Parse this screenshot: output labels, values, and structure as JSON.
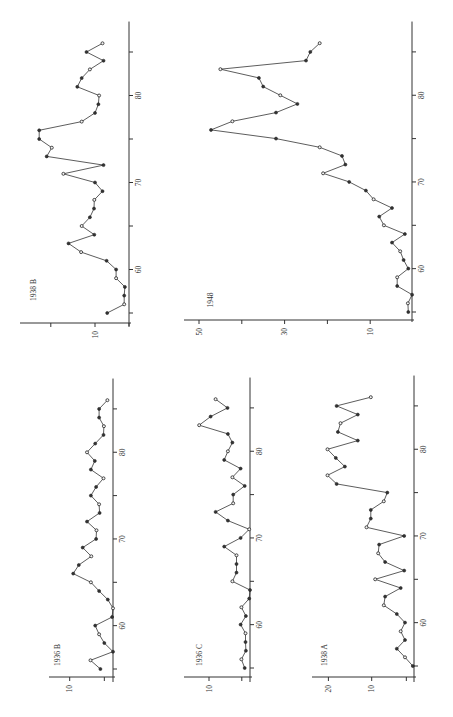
{
  "figure": {
    "orientation_note": "All panels printed rotated 90° counter-clockwise: year axis runs bottom-to-top, value axis runs right-to-left."
  },
  "chart_data": [
    {
      "id": "1938B",
      "type": "line",
      "title": "1938 B",
      "xlabel": "",
      "ylabel": "",
      "x_ticks": [
        55,
        60,
        65,
        70,
        75,
        80,
        85
      ],
      "x_tick_labels": [
        "60",
        "70",
        "80"
      ],
      "y_ticks": [
        0,
        10,
        23
      ],
      "y_tick_labels": [
        "10"
      ],
      "ylim": [
        0,
        32
      ],
      "x": [
        55,
        56,
        57,
        58,
        59,
        60,
        61,
        62,
        63,
        64,
        65,
        66,
        67,
        68,
        69,
        70,
        71,
        72,
        73,
        74,
        75,
        76,
        77,
        78,
        79,
        80,
        81,
        82,
        83,
        84,
        85,
        86
      ],
      "values": [
        6.4,
        1.4,
        1.4,
        1.2,
        3.8,
        3.8,
        6.6,
        14.1,
        17.8,
        10.2,
        13.9,
        11.5,
        10.3,
        10.2,
        7.8,
        10.0,
        19.3,
        7.5,
        24.2,
        22.7,
        26.4,
        26.4,
        13.9,
        10.0,
        9.0,
        8.8,
        15.2,
        13.9,
        11.5,
        7.5,
        12.5,
        7.8
      ]
    },
    {
      "id": "1948",
      "type": "line",
      "title": "1948",
      "xlabel": "",
      "ylabel": "",
      "x_ticks": [
        55,
        60,
        65,
        70,
        75,
        80,
        85
      ],
      "x_tick_labels": [
        "60",
        "70",
        "80"
      ],
      "y_ticks": [
        10,
        20,
        30,
        40,
        50
      ],
      "y_tick_labels": [
        "10",
        "30",
        "50"
      ],
      "ylim": [
        0,
        52
      ],
      "x": [
        55,
        56,
        57,
        58,
        59,
        60,
        61,
        62,
        63,
        64,
        65,
        66,
        67,
        68,
        69,
        70,
        71,
        72,
        73,
        74,
        75,
        76,
        77,
        78,
        79,
        80,
        81,
        82,
        83,
        84,
        85,
        86
      ],
      "values": [
        1.1,
        1.2,
        0.2,
        3.7,
        3.7,
        1.1,
        2.2,
        3.0,
        4.9,
        1.9,
        6.8,
        7.9,
        4.9,
        9.2,
        11.0,
        14.9,
        21.0,
        15.8,
        16.6,
        21.8,
        32.0,
        47.2,
        42.2,
        32.0,
        27.0,
        31.0,
        35.0,
        36.0,
        45.0,
        25.0,
        24.0,
        21.8
      ]
    },
    {
      "id": "1936B",
      "type": "line",
      "title": "1936 B",
      "xlabel": "",
      "ylabel": "",
      "x_ticks": [
        55,
        60,
        65,
        70,
        75,
        80,
        85
      ],
      "x_tick_labels": [
        "60",
        "70",
        "80"
      ],
      "y_ticks": [
        2,
        10
      ],
      "y_tick_labels": [
        "10"
      ],
      "ylim": [
        0,
        15
      ],
      "x": [
        55,
        56,
        57,
        58,
        59,
        60,
        61,
        62,
        63,
        64,
        65,
        66,
        67,
        68,
        69,
        70,
        71,
        72,
        73,
        74,
        75,
        76,
        77,
        78,
        79,
        80,
        81,
        82,
        83,
        84,
        85,
        86
      ],
      "values": [
        2.9,
        5.2,
        0.0,
        2.0,
        3.2,
        4.1,
        0.2,
        0.0,
        1.2,
        3.2,
        5.1,
        9.2,
        7.9,
        5.0,
        7.0,
        3.9,
        3.8,
        6.0,
        3.1,
        3.2,
        5.1,
        3.9,
        2.2,
        5.1,
        4.2,
        6.0,
        4.1,
        2.2,
        2.1,
        3.2,
        3.2,
        1.3
      ]
    },
    {
      "id": "1936C",
      "type": "line",
      "title": "1936 C",
      "xlabel": "",
      "ylabel": "",
      "x_ticks": [
        55,
        60,
        65,
        70,
        75,
        80,
        85
      ],
      "x_tick_labels": [
        "60",
        "70",
        "80"
      ],
      "y_ticks": [
        2,
        10
      ],
      "y_tick_labels": [
        "10"
      ],
      "ylim": [
        0,
        15
      ],
      "x": [
        55,
        56,
        57,
        58,
        59,
        60,
        61,
        62,
        63,
        64,
        65,
        66,
        67,
        68,
        69,
        70,
        71,
        72,
        73,
        74,
        75,
        76,
        77,
        78,
        79,
        80,
        81,
        82,
        83,
        84,
        85,
        86
      ],
      "values": [
        1.3,
        2.1,
        1.0,
        1.1,
        1.1,
        2.3,
        1.0,
        2.1,
        0.2,
        0.0,
        4.3,
        3.3,
        3.3,
        3.3,
        6.3,
        2.3,
        0.2,
        5.4,
        8.4,
        4.1,
        4.1,
        1.3,
        4.3,
        2.3,
        6.3,
        5.4,
        4.3,
        5.4,
        12.4,
        9.6,
        5.5,
        8.4
      ]
    },
    {
      "id": "1938A",
      "type": "line",
      "title": "1938 A",
      "xlabel": "",
      "ylabel": "",
      "x_ticks": [
        55,
        60,
        65,
        70,
        75,
        80,
        85
      ],
      "x_tick_labels": [
        "60",
        "70",
        "80"
      ],
      "y_ticks": [
        2,
        10,
        20
      ],
      "y_tick_labels": [
        "10",
        "20"
      ],
      "ylim": [
        0,
        24
      ],
      "x": [
        55,
        56,
        57,
        58,
        59,
        60,
        61,
        62,
        63,
        64,
        65,
        66,
        67,
        68,
        69,
        70,
        71,
        72,
        73,
        74,
        75,
        76,
        77,
        78,
        79,
        80,
        81,
        82,
        83,
        84,
        85,
        86
      ],
      "values": [
        0.5,
        2.3,
        4.2,
        2.3,
        3.3,
        2.3,
        4.2,
        7.2,
        6.9,
        3.3,
        9.2,
        2.5,
        6.9,
        8.5,
        8.3,
        2.5,
        11.2,
        10.2,
        10.2,
        7.2,
        6.4,
        18.1,
        20.2,
        16.2,
        18.3,
        20.2,
        13.2,
        17.8,
        17.2,
        13.2,
        18.1,
        10.2
      ]
    }
  ],
  "panels": [
    {
      "id": "1938B",
      "left": 0,
      "top": 0,
      "width": 140,
      "height": 340,
      "axis_x": 129,
      "base_y": 322,
      "year55_y": 313,
      "px_per_year": 8.7,
      "zero_x": 129,
      "px_per_unit": 3.4,
      "value_axis_y": 323,
      "value_axis_left": 20,
      "label_x": 36,
      "label_y": 290
    },
    {
      "id": "1948",
      "left": 170,
      "top": 0,
      "width": 283,
      "height": 340,
      "axis_x": 242,
      "base_y": 318,
      "year55_y": 312,
      "px_per_year": 8.67,
      "zero_x": 243,
      "px_per_unit": 4.28,
      "value_axis_y": 320,
      "value_axis_left": 14,
      "label_x": 43,
      "label_y": 300
    },
    {
      "id": "1936B",
      "left": 0,
      "top": 360,
      "width": 150,
      "height": 357,
      "axis_x": 113,
      "base_y": 318,
      "year55_y": 309,
      "px_per_year": 8.67,
      "zero_x": 113,
      "px_per_unit": 4.33,
      "value_axis_y": 317,
      "value_axis_left": 49,
      "label_x": 60,
      "label_y": 295
    },
    {
      "id": "1936C",
      "left": 140,
      "top": 360,
      "width": 150,
      "height": 357,
      "axis_x": 110,
      "base_y": 318,
      "year55_y": 308,
      "px_per_year": 8.67,
      "zero_x": 110,
      "px_per_unit": 4.1,
      "value_axis_y": 317,
      "value_axis_left": 44,
      "label_x": 62,
      "label_y": 295
    },
    {
      "id": "1938A",
      "left": 290,
      "top": 360,
      "width": 163,
      "height": 357,
      "axis_x": 124,
      "base_y": 318,
      "year55_y": 306,
      "px_per_year": 8.67,
      "zero_x": 125,
      "px_per_unit": 4.33,
      "value_axis_y": 317,
      "value_axis_left": 22,
      "label_x": 37,
      "label_y": 295
    }
  ]
}
